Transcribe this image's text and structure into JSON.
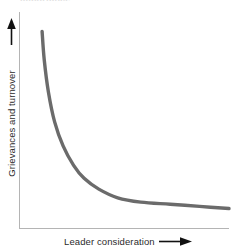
{
  "figure": {
    "top_fragment": "importance",
    "background_color": "#ffffff"
  },
  "axes": {
    "y": {
      "label": "Grievances and turnover",
      "arrow_icon": "arrow-up-icon",
      "arrow_direction": "up",
      "line_color": "#b4b4b4"
    },
    "x": {
      "label": "Leader consideration",
      "arrow_icon": "arrow-right-icon",
      "arrow_direction": "right",
      "line_color": "#b4b4b4"
    }
  },
  "chart_data": {
    "type": "line",
    "title": "",
    "xlabel": "Leader consideration",
    "ylabel": "Grievances and turnover",
    "xlim": [
      0,
      1
    ],
    "ylim": [
      0,
      1
    ],
    "grid": false,
    "legend": null,
    "axis_ticks": {
      "x": [],
      "y": []
    },
    "series": [
      {
        "name": "Grievances and turnover vs. leader consideration",
        "color": "#6b6b6b",
        "line_width": 3,
        "shape": "steep hyperbolic decay, L-shaped elbow, flattening asymptote",
        "x": [
          0.11,
          0.12,
          0.14,
          0.17,
          0.21,
          0.26,
          0.31,
          0.38,
          0.47,
          0.58,
          0.72,
          0.86,
          1.0
        ],
        "y": [
          0.91,
          0.78,
          0.63,
          0.49,
          0.38,
          0.29,
          0.23,
          0.18,
          0.14,
          0.12,
          0.11,
          0.1,
          0.09
        ]
      }
    ]
  },
  "colors": {
    "curve": "#6b6b6b",
    "axis_line": "#b4b4b4",
    "text": "#2b2b2b",
    "background": "#ffffff"
  }
}
